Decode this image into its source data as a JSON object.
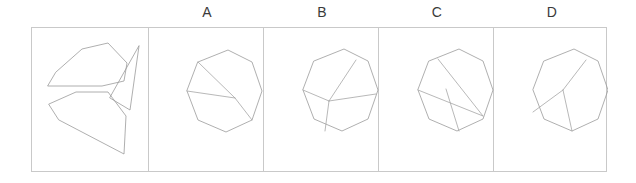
{
  "puzzle": {
    "type": "shape-assembly-multiple-choice",
    "frame": {
      "border_color": "#c9c9c9",
      "background": "#ffffff"
    },
    "stroke_color": "#9a9a9a",
    "label_color": "#3a3a3a",
    "options": [
      {
        "id": "A",
        "label": "A",
        "left": 149,
        "center_x": 207
      },
      {
        "id": "B",
        "label": "B",
        "left": 264,
        "center_x": 322
      },
      {
        "id": "C",
        "label": "C",
        "left": 379,
        "center_x": 437
      },
      {
        "id": "D",
        "label": "D",
        "left": 494,
        "center_x": 552
      }
    ],
    "pieces_panel": {
      "name": "pieces-panel",
      "piece_count": 3,
      "pieces": [
        {
          "name": "piece-top-pentagon",
          "points": "24,44 50,21 76,15 95,35 92,53 70,58 16,58"
        },
        {
          "name": "piece-right-triangle",
          "points": "107,18 98,82 78,70"
        },
        {
          "name": "piece-bottom-polygon",
          "points": "17,76 44,64 76,64 94,88 92,126 27,92"
        }
      ]
    },
    "option_shapes": {
      "A": {
        "name": "octagon-option-a",
        "outline": "49,34 79,22 103,34 113,63 103,92 77,104 49,92 38,63",
        "cuts": [
          {
            "name": "cut-line-1",
            "d": "M 49,34 L 86,70"
          },
          {
            "name": "cut-line-2",
            "d": "M 38,63 L 86,70"
          },
          {
            "name": "cut-line-3",
            "d": "M 86,70 L 103,92"
          }
        ]
      },
      "B": {
        "name": "octagon-option-b",
        "outline": "50,33 80,21 104,33 114,62 104,91 78,103 50,91 39,62",
        "cuts": [
          {
            "name": "cut-line-1",
            "d": "M 92,32 L 65,73"
          },
          {
            "name": "cut-line-2",
            "d": "M 39,62 L 65,73"
          },
          {
            "name": "cut-line-3",
            "d": "M 65,73 L 61,103"
          },
          {
            "name": "cut-line-4",
            "d": "M 65,73 L 112,66"
          }
        ]
      },
      "C": {
        "name": "octagon-option-c",
        "outline": "50,33 80,21 104,33 114,62 104,91 78,103 50,91 39,62",
        "cuts": [
          {
            "name": "cut-line-1",
            "d": "M 59,31 L 104,88"
          },
          {
            "name": "cut-line-2",
            "d": "M 39,62 L 104,88"
          },
          {
            "name": "cut-line-3",
            "d": "M 67,61 L 80,103"
          }
        ]
      },
      "D": {
        "name": "octagon-option-d",
        "outline": "50,33 80,21 104,33 114,62 104,91 78,103 50,91 39,62",
        "cuts": [
          {
            "name": "cut-line-1",
            "d": "M 92,32 L 69,62"
          },
          {
            "name": "cut-line-2",
            "d": "M 69,62 L 39,84"
          },
          {
            "name": "cut-line-3",
            "d": "M 69,62 L 78,103"
          }
        ]
      }
    }
  }
}
